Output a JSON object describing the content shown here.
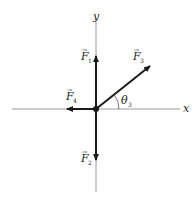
{
  "diagram": {
    "title": "",
    "axes": {
      "x_label": "x",
      "y_label": "y"
    },
    "vectors": [
      {
        "name": "F",
        "subscript": "1",
        "direction": "up"
      },
      {
        "name": "F",
        "subscript": "2",
        "direction": "down"
      },
      {
        "name": "F",
        "subscript": "3",
        "direction": "up-right"
      },
      {
        "name": "F",
        "subscript": "4",
        "direction": "left"
      }
    ],
    "angle": {
      "symbol": "θ",
      "subscript": "3"
    },
    "colors": {
      "axis": "#999999",
      "vector": "#1a1a1a",
      "background": "#ffffff"
    }
  }
}
